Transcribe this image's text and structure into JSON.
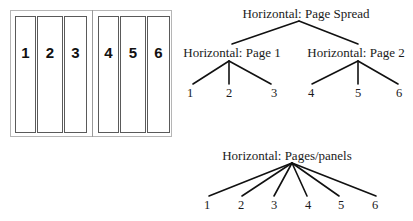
{
  "spread_diagram": {
    "panels": [
      {
        "label": "1"
      },
      {
        "label": "2"
      },
      {
        "label": "3"
      },
      {
        "label": "4"
      },
      {
        "label": "5"
      },
      {
        "label": "6"
      }
    ]
  },
  "tree_spread": {
    "root": "Horizontal: Page Spread",
    "page1": {
      "label": "Horizontal: Page 1",
      "leaves": [
        "1",
        "2",
        "3"
      ]
    },
    "page2": {
      "label": "Horizontal: Page 2",
      "leaves": [
        "4",
        "5",
        "6"
      ]
    }
  },
  "tree_panels": {
    "root": "Horizontal: Pages/panels",
    "leaves": [
      "1",
      "2",
      "3",
      "4",
      "5",
      "6"
    ]
  },
  "colors": {
    "line": "#111111",
    "panel_border": "#5a5a5a",
    "outer_border": "#b5b5b5"
  }
}
